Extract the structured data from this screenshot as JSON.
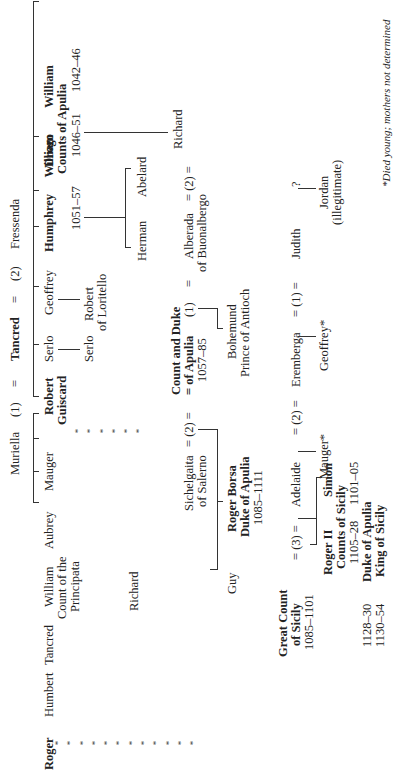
{
  "title_row": {
    "muriella": "Muriella",
    "marriage1": "(1)",
    "eq1": "=",
    "tancred": "Tancred",
    "eq2": "=",
    "marriage2": "(2)",
    "fressenda": "Fressenda"
  },
  "children_gen1": [
    {
      "name": "William",
      "sub": "",
      "bold": true
    },
    {
      "name": "Drogo",
      "bold": true
    },
    {
      "name": "Humphrey",
      "bold": true
    },
    {
      "name": "Geoffrey",
      "bold": false
    },
    {
      "name": "Serlo",
      "bold": false
    },
    {
      "name": "Robert",
      "name2": "Guiscard",
      "bold": true
    },
    {
      "name": "Mauger",
      "bold": false
    },
    {
      "name": "Aubrey",
      "bold": false
    },
    {
      "name": "William",
      "sub1": "Count of the",
      "sub2": "Principata",
      "bold": false
    },
    {
      "name": "Tancred",
      "bold": false
    },
    {
      "name": "Humbert",
      "bold": false
    },
    {
      "name": "Roger",
      "bold": true
    }
  ],
  "counts_of_apulia": {
    "label": "Counts of Apulia",
    "william_dates": "1042–46",
    "drogo_dates": "1046–51",
    "humphrey_dates": "1051–57"
  },
  "gen2": {
    "robert_of_loritello": [
      "Robert",
      "of Loritello"
    ],
    "serlo_son": "Serlo",
    "richard_son_of_william": "Richard",
    "abelard": "Abelard",
    "herman": "Herman",
    "richard_of_drogo": "Richard"
  },
  "guiscard_marriages": {
    "richard_eq": "= (2) =",
    "alberada": [
      "Alberada",
      "of Buonalbergo"
    ],
    "eq_a": "=",
    "m1": "(1)",
    "title_line1": "Count and Duke",
    "title_line2": "= of Apulia",
    "dates": "1057–85",
    "eq_b": "= (2) =",
    "sichelgaita": [
      "Sichelgaita",
      "of Salerno"
    ]
  },
  "guiscard_children": {
    "bohemund": [
      "Bohemund",
      "Prince of Antioch"
    ],
    "roger_borsa": [
      "Roger Borsa",
      "Duke of Apulia",
      "1085–1111"
    ],
    "guy": "Guy"
  },
  "roger_marriages": {
    "unknown": "?",
    "judith": "Judith",
    "eq1": "= (1) =",
    "eremberga": "Eremberga",
    "eq2": "= (2) =",
    "adelaide": "Adelaide",
    "eq3": "= (3) =",
    "title": [
      "Great Count",
      "of Sicily",
      "1085–1101"
    ]
  },
  "roger_children": {
    "jordan": [
      "Jordan",
      "(illegitimate)"
    ],
    "geoffrey": "Geoffrey*",
    "mauger": "Mauger*",
    "simon": "Simon",
    "roger2": "Roger II",
    "counts_of_sicily": "Counts of Sicily",
    "simon_dates": "1101–05",
    "roger2_dates": "1105–28",
    "duke_of_apulia": "Duke of Apulia",
    "duke_dates": "1128–30",
    "king_of_sicily": "King of Sicily",
    "king_dates": "1130–54"
  },
  "footnote": "*Died young; mothers not determined",
  "dots": "* * * * * * * * * * * *"
}
